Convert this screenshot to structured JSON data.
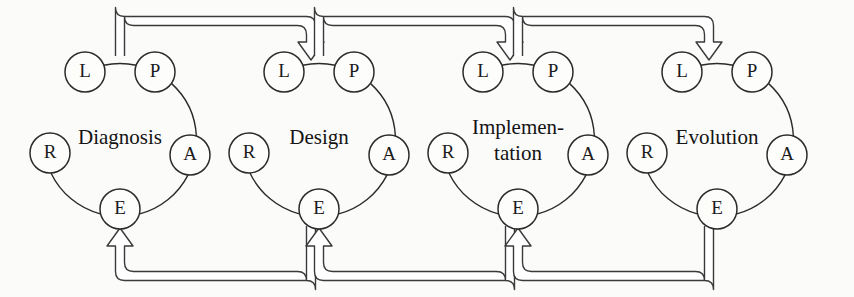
{
  "diagram": {
    "background_color": "#fbfbfa",
    "line_color": "#2b2b2b",
    "node_fill": "#fdfdfc",
    "node_radius": 20,
    "cycle_spacing": 199,
    "node_labels": {
      "L": "L",
      "P": "P",
      "A": "A",
      "E": "E",
      "R": "R"
    },
    "cycles": [
      {
        "id": "cycle-diagnosis",
        "name": "Diagnosis",
        "lines": [
          "Diagnosis"
        ],
        "center_x": 120,
        "center_y": 140,
        "nodes": [
          {
            "key": "L",
            "label": "L",
            "cx": 85,
            "cy": 72
          },
          {
            "key": "P",
            "label": "P",
            "cx": 155,
            "cy": 72
          },
          {
            "key": "A",
            "label": "A",
            "cx": 190,
            "cy": 155
          },
          {
            "key": "E",
            "label": "E",
            "cx": 120,
            "cy": 209
          },
          {
            "key": "R",
            "label": "R",
            "cx": 50,
            "cy": 153
          }
        ]
      },
      {
        "id": "cycle-design",
        "name": "Design",
        "lines": [
          "Design"
        ],
        "center_x": 319,
        "center_y": 140,
        "nodes": [
          {
            "key": "L",
            "label": "L",
            "cx": 284,
            "cy": 72
          },
          {
            "key": "P",
            "label": "P",
            "cx": 354,
            "cy": 72
          },
          {
            "key": "A",
            "label": "A",
            "cx": 389,
            "cy": 155
          },
          {
            "key": "E",
            "label": "E",
            "cx": 319,
            "cy": 209
          },
          {
            "key": "R",
            "label": "R",
            "cx": 249,
            "cy": 153
          }
        ]
      },
      {
        "id": "cycle-implementation",
        "name": "Implementation",
        "lines": [
          "Implemen-",
          "tation"
        ],
        "center_x": 518,
        "center_y": 140,
        "nodes": [
          {
            "key": "L",
            "label": "L",
            "cx": 483,
            "cy": 72
          },
          {
            "key": "P",
            "label": "P",
            "cx": 553,
            "cy": 72
          },
          {
            "key": "A",
            "label": "A",
            "cx": 588,
            "cy": 155
          },
          {
            "key": "E",
            "label": "E",
            "cx": 518,
            "cy": 209
          },
          {
            "key": "R",
            "label": "R",
            "cx": 448,
            "cy": 153
          }
        ]
      },
      {
        "id": "cycle-evolution",
        "name": "Evolution",
        "lines": [
          "Evolution"
        ],
        "center_x": 717,
        "center_y": 140,
        "nodes": [
          {
            "key": "L",
            "label": "L",
            "cx": 682,
            "cy": 72
          },
          {
            "key": "P",
            "label": "P",
            "cx": 752,
            "cy": 72
          },
          {
            "key": "A",
            "label": "A",
            "cx": 787,
            "cy": 155
          },
          {
            "key": "E",
            "label": "E",
            "cx": 717,
            "cy": 209
          },
          {
            "key": "R",
            "label": "R",
            "cx": 647,
            "cy": 153
          }
        ]
      }
    ],
    "forward_connectors": [
      {
        "id": "forward-diagnosis-to-design",
        "from": "Diagnosis",
        "to": "Design",
        "from_x": 120,
        "to_x": 311,
        "direction": "right"
      },
      {
        "id": "forward-design-to-implementation",
        "from": "Design",
        "to": "Implementation",
        "from_x": 319,
        "to_x": 510,
        "direction": "right"
      },
      {
        "id": "forward-implementation-to-evolution",
        "from": "Implementation",
        "to": "Evolution",
        "from_x": 518,
        "to_x": 709,
        "direction": "right"
      }
    ],
    "feedback_connectors": [
      {
        "id": "feedback-design-to-diagnosis",
        "from": "Design",
        "to": "Diagnosis",
        "from_x": 311,
        "to_x": 120,
        "direction": "left"
      },
      {
        "id": "feedback-implementation-to-design",
        "from": "Implementation",
        "to": "Design",
        "from_x": 510,
        "to_x": 319,
        "direction": "left"
      },
      {
        "id": "feedback-evolution-to-implementation",
        "from": "Evolution",
        "to": "Implementation",
        "from_x": 709,
        "to_x": 518,
        "direction": "left"
      }
    ]
  }
}
